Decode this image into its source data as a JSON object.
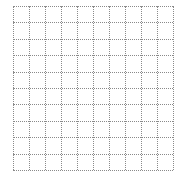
{
  "grid": {
    "columns": 10,
    "rows": 10,
    "line_style": "dotted",
    "line_color": "#8a8a8a",
    "background_color": "#ffffff"
  }
}
